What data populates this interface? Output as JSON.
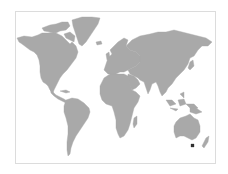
{
  "map": {
    "type": "world-map",
    "land_color": "#a9a9a9",
    "background_color": "#ffffff",
    "frame_color": "#dcdcdc",
    "highlight": {
      "region": "Tasmania",
      "color": "#333333"
    }
  }
}
